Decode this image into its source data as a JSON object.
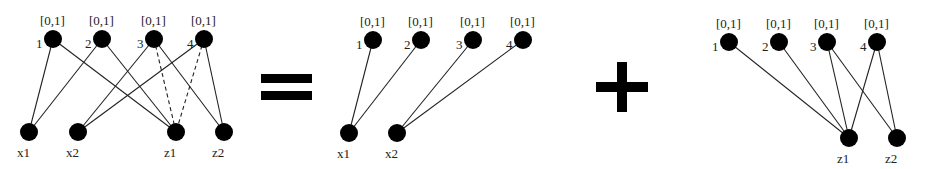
{
  "diagrams": [
    {
      "id": "full",
      "top_nodes": [
        {
          "id": "1",
          "label": "1",
          "interval": "[0,1]",
          "x": 53,
          "y": 39
        },
        {
          "id": "2",
          "label": "2",
          "interval": "[0,1]",
          "x": 102,
          "y": 39
        },
        {
          "id": "3",
          "label": "3",
          "interval": "[0,1]",
          "x": 154,
          "y": 39
        },
        {
          "id": "4",
          "label": "4",
          "interval": "[0,1]",
          "x": 204,
          "y": 39
        }
      ],
      "bottom_nodes": [
        {
          "id": "x1",
          "label": "x1",
          "x": 29,
          "y": 132
        },
        {
          "id": "x2",
          "label": "x2",
          "x": 78,
          "y": 132
        },
        {
          "id": "z1",
          "label": "z1",
          "x": 176,
          "y": 132
        },
        {
          "id": "z2",
          "label": "z2",
          "x": 224,
          "y": 132
        }
      ],
      "edges": [
        {
          "from": "1",
          "to": "x1",
          "style": "solid"
        },
        {
          "from": "1",
          "to": "z1",
          "style": "solid"
        },
        {
          "from": "2",
          "to": "x1",
          "style": "solid"
        },
        {
          "from": "2",
          "to": "z1",
          "style": "solid"
        },
        {
          "from": "3",
          "to": "x2",
          "style": "solid"
        },
        {
          "from": "3",
          "to": "z2",
          "style": "solid"
        },
        {
          "from": "3",
          "to": "z1",
          "style": "dashed"
        },
        {
          "from": "4",
          "to": "x2",
          "style": "solid"
        },
        {
          "from": "4",
          "to": "z2",
          "style": "solid"
        },
        {
          "from": "4",
          "to": "z1",
          "style": "dashed"
        }
      ]
    },
    {
      "id": "x-part",
      "top_nodes": [
        {
          "id": "1",
          "label": "1",
          "interval": "[0,1]",
          "x": 373,
          "y": 40
        },
        {
          "id": "2",
          "label": "2",
          "interval": "[0,1]",
          "x": 421,
          "y": 40
        },
        {
          "id": "3",
          "label": "3",
          "interval": "[0,1]",
          "x": 473,
          "y": 40
        },
        {
          "id": "4",
          "label": "4",
          "interval": "[0,1]",
          "x": 523,
          "y": 40
        }
      ],
      "bottom_nodes": [
        {
          "id": "x1",
          "label": "x1",
          "x": 349,
          "y": 133
        },
        {
          "id": "x2",
          "label": "x2",
          "x": 397,
          "y": 133
        }
      ],
      "edges": [
        {
          "from": "1",
          "to": "x1",
          "style": "solid"
        },
        {
          "from": "2",
          "to": "x1",
          "style": "solid"
        },
        {
          "from": "3",
          "to": "x2",
          "style": "solid"
        },
        {
          "from": "4",
          "to": "x2",
          "style": "solid"
        }
      ]
    },
    {
      "id": "z-part",
      "top_nodes": [
        {
          "id": "1",
          "label": "1",
          "interval": "[0,1]",
          "x": 729,
          "y": 42
        },
        {
          "id": "2",
          "label": "2",
          "interval": "[0,1]",
          "x": 779,
          "y": 42
        },
        {
          "id": "3",
          "label": "3",
          "interval": "[0,1]",
          "x": 827,
          "y": 42
        },
        {
          "id": "4",
          "label": "4",
          "interval": "[0,1]",
          "x": 877,
          "y": 42
        }
      ],
      "bottom_nodes": [
        {
          "id": "z1",
          "label": "z1",
          "x": 849,
          "y": 138
        },
        {
          "id": "z2",
          "label": "z2",
          "x": 897,
          "y": 138
        }
      ],
      "edges": [
        {
          "from": "1",
          "to": "z1",
          "style": "solid"
        },
        {
          "from": "2",
          "to": "z1",
          "style": "solid"
        },
        {
          "from": "3",
          "to": "z1",
          "style": "solid"
        },
        {
          "from": "3",
          "to": "z2",
          "style": "solid"
        },
        {
          "from": "4",
          "to": "z1",
          "style": "solid"
        },
        {
          "from": "4",
          "to": "z2",
          "style": "solid"
        }
      ]
    }
  ],
  "operators": [
    {
      "symbol": "=",
      "name": "equals-sign"
    },
    {
      "symbol": "+",
      "name": "plus-sign"
    }
  ],
  "colors": {
    "node": "#000000",
    "edge": "#222222",
    "background": "#ffffff"
  }
}
